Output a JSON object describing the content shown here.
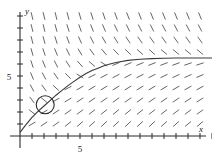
{
  "figure": {
    "type": "slope-field",
    "axis_labels": {
      "x": "x",
      "y": "y"
    },
    "tick_labels": {
      "x": [
        "5"
      ],
      "y": [
        "5"
      ]
    },
    "colors": {
      "axis": "#2b2b2b",
      "curve": "#3a3a3a",
      "field": "#555555",
      "circle": "#2b2b2b",
      "background": "#ffffff"
    }
  },
  "chart_data": {
    "type": "line",
    "title": "",
    "xlabel": "x",
    "ylabel": "y",
    "xlim": [
      0,
      16
    ],
    "ylim": [
      0,
      10.5
    ],
    "grid": false,
    "legend": "none",
    "xticks": [
      1,
      2,
      3,
      4,
      5,
      6,
      7,
      8,
      9,
      10,
      11,
      12,
      13,
      14,
      15,
      16
    ],
    "yticks": [
      1,
      2,
      3,
      4,
      5,
      6,
      7,
      8,
      9,
      10
    ],
    "xtick_labels": {
      "5": "5"
    },
    "ytick_labels": {
      "5": "5"
    },
    "series": [
      {
        "name": "solution-curve",
        "comment": "rising concave-down solution approaching horizontal asymptote y = 6.5",
        "x": [
          0.0,
          0.5,
          1.0,
          1.5,
          2.0,
          2.5,
          3.0,
          3.5,
          4.0,
          4.5,
          5.0,
          5.5,
          6.0,
          6.5,
          7.0,
          7.5,
          8.0,
          9.0,
          10.0,
          11.0,
          12.0,
          13.0,
          14.0,
          15.0,
          16.0
        ],
        "y": [
          0.3,
          0.95,
          1.55,
          2.05,
          2.5,
          2.95,
          3.4,
          3.8,
          4.2,
          4.55,
          4.9,
          5.2,
          5.45,
          5.65,
          5.85,
          6.0,
          6.12,
          6.3,
          6.4,
          6.45,
          6.48,
          6.5,
          6.5,
          6.5,
          6.5
        ]
      }
    ],
    "annotations": [
      {
        "name": "initial-condition-circle",
        "shape": "circle",
        "center": [
          2.1,
          2.6
        ],
        "radius_px": 9
      }
    ],
    "slope_field": {
      "comment": "short tangent segments on integer lattice; positive shallow slopes below the solution curve, steep negative-leaning marks above it",
      "x_range": [
        1,
        16
      ],
      "y_range": [
        1,
        10
      ],
      "segment_length_px": 7
    }
  }
}
